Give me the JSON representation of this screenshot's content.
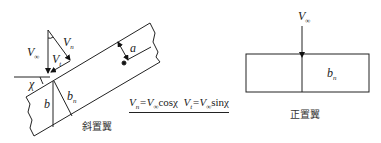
{
  "swept_wing": {
    "caption": "斜置翼",
    "labels": {
      "v_inf": "V",
      "v_inf_sub": "∞",
      "v_n": "V",
      "v_n_sub": "n",
      "v_t": "V",
      "v_t_sub": "t",
      "chi": "χ",
      "a": "a",
      "b": "b",
      "b_n": "b",
      "b_n_sub": "n"
    }
  },
  "formula": {
    "part1_lhs": "V",
    "part1_lhs_sub": "n",
    "part1_rhs": "=V",
    "part1_rhs_sub": "∞",
    "part1_fn": "cosχ",
    "part2_lhs": "V",
    "part2_lhs_sub": "t",
    "part2_rhs": "=V",
    "part2_rhs_sub": "∞",
    "part2_fn": "sinχ"
  },
  "straight_wing": {
    "caption": "正置翼",
    "labels": {
      "v_inf": "V",
      "v_inf_sub": "∞",
      "b_n": "b",
      "b_n_sub": "n"
    }
  }
}
